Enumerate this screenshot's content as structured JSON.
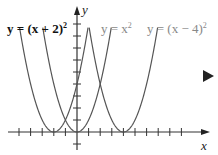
{
  "figure": {
    "labels": [
      {
        "text": "y = (x + 2)",
        "exp": "2",
        "color": "#111111"
      },
      {
        "text": "y = x",
        "exp": "2",
        "color": "#888888"
      },
      {
        "text": "y = (x − 4)",
        "exp": "2",
        "color": "#888888"
      }
    ],
    "x_axis_label": "x",
    "y_axis_label": "y",
    "next_icon": "play-triangle-icon"
  },
  "chart_data": {
    "type": "line",
    "title": "",
    "xlabel": "x",
    "ylabel": "y",
    "series": [
      {
        "name": "y = (x + 2)^2",
        "vertex": [
          -2,
          0
        ],
        "color": "#555555"
      },
      {
        "name": "y = x^2",
        "vertex": [
          0,
          0
        ],
        "color": "#555555"
      },
      {
        "name": "y = (x - 4)^2",
        "vertex": [
          4,
          0
        ],
        "color": "#555555"
      }
    ],
    "xlim": [
      -5,
      9
    ],
    "ylim": [
      -1,
      10
    ],
    "x_ticks": [
      -5,
      -4,
      -3,
      -2,
      -1,
      1,
      2,
      3,
      4,
      5,
      6,
      7,
      8,
      9
    ],
    "y_ticks": [
      -1,
      1,
      2,
      3,
      4,
      5,
      6,
      7,
      8,
      9
    ],
    "grid": false
  }
}
